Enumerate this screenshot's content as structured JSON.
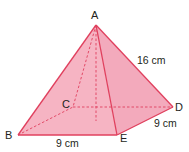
{
  "figure": {
    "type": "square-based pyramid",
    "colors": {
      "face_fill": "#f4a7b9",
      "edge_stroke": "#e0405e",
      "hidden_stroke": "#e0405e",
      "text": "#231f20"
    },
    "vertices": {
      "A": {
        "label": "A",
        "x": 96,
        "y": 25
      },
      "B": {
        "label": "B",
        "x": 18,
        "y": 135
      },
      "C": {
        "label": "C",
        "x": 73,
        "y": 107
      },
      "D": {
        "label": "D",
        "x": 173,
        "y": 107
      },
      "E": {
        "label": "E",
        "x": 117,
        "y": 135
      }
    },
    "measurements": {
      "AD": "16 cm",
      "BE": "9 cm",
      "ED": "9 cm"
    }
  }
}
